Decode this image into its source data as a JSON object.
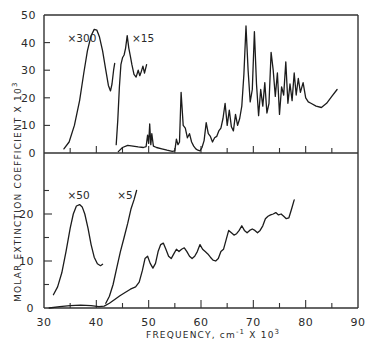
{
  "chart_data": [
    {
      "panel": "upper",
      "type": "line",
      "xlabel": "FREQUENCY, cm-1 X 10^3",
      "ylabel": "MOLAR EXTINCTION COEFFICIENT X 10^3",
      "xlim": [
        30,
        90
      ],
      "ylim": [
        0,
        50
      ],
      "x_ticks": [
        35,
        40,
        45,
        50,
        55,
        60,
        65,
        70,
        75,
        80,
        85
      ],
      "y_ticks": [
        0,
        10,
        20,
        30,
        40,
        50
      ],
      "y_tick_labels": [
        "0",
        "10",
        "20",
        "30",
        "40",
        "50"
      ],
      "grid": false,
      "annotations": [
        {
          "text": "x 300",
          "x": 34.5,
          "y": 41.5
        },
        {
          "text": "x 15",
          "x": 46.8,
          "y": 41.5
        }
      ],
      "series": [
        {
          "name": "x300",
          "scale": 300,
          "x": [
            33.8,
            34.8,
            35.8,
            36.8,
            37.6,
            38.3,
            39.0,
            39.6,
            40.1,
            40.6,
            41.2,
            41.8,
            42.3,
            42.7,
            43.0,
            43.3,
            43.5
          ],
          "y": [
            1.5,
            4.0,
            10.0,
            19.0,
            29.0,
            37.0,
            42.5,
            44.8,
            44.5,
            42.0,
            37.0,
            30.0,
            24.5,
            22.5,
            25.0,
            30.0,
            32.5
          ]
        },
        {
          "name": "x15",
          "scale": 15,
          "x": [
            43.8,
            44.1,
            44.4,
            44.7,
            45.0,
            45.3,
            45.6,
            45.9,
            46.2,
            46.5,
            46.8,
            47.2,
            47.6,
            48.0,
            48.3,
            48.6,
            48.9,
            49.2,
            49.6
          ],
          "y": [
            3.0,
            12.0,
            24.0,
            32.0,
            34.5,
            35.5,
            38.0,
            42.5,
            38.0,
            35.0,
            32.0,
            28.5,
            27.5,
            30.0,
            28.0,
            29.5,
            31.5,
            29.0,
            32.0
          ]
        },
        {
          "name": "x1",
          "scale": 1,
          "x": [
            44.2,
            45.0,
            46.0,
            47.0,
            48.0,
            49.0,
            49.5,
            49.8,
            50.0,
            50.2,
            50.4,
            50.6,
            50.9,
            51.5,
            52.5,
            53.5,
            54.5,
            55.0,
            55.3,
            55.6,
            55.9,
            56.2,
            56.6,
            57.0,
            57.4,
            57.8,
            58.2,
            58.6,
            59.0,
            59.4,
            59.8,
            60.2,
            60.6,
            61.0,
            61.4,
            61.8,
            62.2,
            62.6,
            63.0,
            63.4,
            63.8,
            64.2,
            64.6,
            65.0,
            65.4,
            65.8,
            66.2,
            66.6,
            67.0,
            67.4,
            67.8,
            68.2,
            68.6,
            69.0,
            69.4,
            69.8,
            70.2,
            70.6,
            71.0,
            71.4,
            71.8,
            72.2,
            72.6,
            73.0,
            73.4,
            73.8,
            74.2,
            74.6,
            75.0,
            75.4,
            75.8,
            76.2,
            76.6,
            77.0,
            77.4,
            77.8,
            78.2,
            78.6,
            79.0,
            79.5,
            80.0,
            80.5,
            81.0,
            82.0,
            83.0,
            84.0,
            85.0,
            86.0
          ],
          "y": [
            0.5,
            2.0,
            2.8,
            2.5,
            2.2,
            2.0,
            2.3,
            6.5,
            3.5,
            10.5,
            3.0,
            7.0,
            2.5,
            2.0,
            1.5,
            1.0,
            0.6,
            0.8,
            5.0,
            3.0,
            4.0,
            22.0,
            10.0,
            9.0,
            5.5,
            7.0,
            4.0,
            2.5,
            1.5,
            1.0,
            0.8,
            2.0,
            4.5,
            11.0,
            7.0,
            6.0,
            4.0,
            5.5,
            6.0,
            8.0,
            9.0,
            12.5,
            18.0,
            10.0,
            15.5,
            9.5,
            8.0,
            14.0,
            10.0,
            12.5,
            17.0,
            28.5,
            46.0,
            30.0,
            18.5,
            23.0,
            44.0,
            25.0,
            13.5,
            23.0,
            17.0,
            25.5,
            14.5,
            18.0,
            36.5,
            30.0,
            20.5,
            29.0,
            14.0,
            24.0,
            21.0,
            33.0,
            18.0,
            25.0,
            19.0,
            29.0,
            21.0,
            27.0,
            22.0,
            25.5,
            20.0,
            18.5,
            18.0,
            17.0,
            16.5,
            18.0,
            20.5,
            23.0
          ]
        }
      ]
    },
    {
      "panel": "lower",
      "type": "line",
      "xlim": [
        30,
        90
      ],
      "ylim": [
        0,
        30
      ],
      "x_ticks": [
        30,
        35,
        40,
        45,
        50,
        55,
        60,
        65,
        70,
        75,
        80,
        85,
        90
      ],
      "x_tick_labels": [
        "30",
        "40",
        "50",
        "60",
        "70",
        "80",
        "90"
      ],
      "x_tick_label_values": [
        30,
        40,
        50,
        60,
        70,
        80,
        90
      ],
      "y_ticks": [
        0,
        5,
        10,
        15,
        20,
        25
      ],
      "y_tick_labels": [
        "0",
        "10",
        "20"
      ],
      "y_tick_label_values": [
        0,
        10,
        20
      ],
      "grid": false,
      "annotations": [
        {
          "text": "x 50",
          "x": 34.5,
          "y": 24.0
        },
        {
          "text": "x 5",
          "x": 44.0,
          "y": 24.0
        }
      ],
      "series": [
        {
          "name": "x50",
          "scale": 50,
          "x": [
            31.8,
            32.6,
            33.4,
            34.2,
            35.0,
            35.6,
            36.2,
            36.8,
            37.3,
            37.8,
            38.4,
            39.0,
            39.6,
            40.2,
            40.8,
            41.2
          ],
          "y": [
            2.8,
            4.5,
            7.5,
            12.0,
            17.0,
            20.0,
            21.7,
            22.0,
            21.5,
            20.0,
            17.0,
            13.5,
            10.8,
            9.4,
            9.0,
            9.3
          ]
        },
        {
          "name": "x5",
          "scale": 5,
          "x": [
            41.8,
            42.5,
            43.2,
            43.9,
            44.6,
            45.3,
            46.0,
            46.6,
            47.2,
            47.7
          ],
          "y": [
            1.0,
            2.5,
            5.0,
            8.5,
            12.0,
            15.0,
            18.0,
            21.0,
            23.0,
            25.0
          ]
        },
        {
          "name": "x1",
          "scale": 1,
          "x": [
            31.0,
            33.0,
            35.0,
            37.0,
            39.0,
            40.5,
            41.5,
            42.5,
            43.5,
            44.5,
            45.5,
            46.5,
            47.5,
            48.2,
            48.8,
            49.3,
            49.8,
            50.3,
            50.8,
            51.3,
            51.8,
            52.3,
            52.8,
            53.3,
            53.8,
            54.3,
            54.8,
            55.3,
            55.8,
            56.3,
            56.8,
            57.3,
            57.8,
            58.3,
            58.8,
            59.3,
            59.8,
            60.3,
            60.8,
            61.3,
            61.8,
            62.3,
            62.8,
            63.3,
            63.8,
            64.3,
            64.8,
            65.3,
            65.8,
            66.3,
            66.8,
            67.3,
            67.8,
            68.3,
            68.8,
            69.3,
            69.8,
            70.3,
            70.8,
            71.3,
            71.8,
            72.3,
            72.8,
            73.3,
            73.8,
            74.3,
            74.8,
            75.3,
            75.8,
            76.3,
            76.8,
            77.3,
            77.8
          ],
          "y": [
            0.0,
            0.3,
            0.5,
            0.6,
            0.5,
            0.3,
            0.4,
            1.0,
            1.8,
            2.6,
            3.3,
            4.0,
            4.5,
            5.5,
            8.0,
            10.5,
            11.0,
            9.5,
            8.5,
            9.5,
            12.0,
            13.5,
            13.8,
            12.5,
            11.0,
            10.5,
            11.5,
            12.5,
            12.0,
            12.5,
            12.8,
            12.0,
            11.0,
            10.5,
            11.0,
            12.0,
            13.5,
            12.5,
            12.0,
            11.5,
            10.8,
            10.2,
            10.0,
            10.5,
            12.0,
            12.5,
            14.5,
            16.5,
            16.0,
            15.5,
            15.8,
            16.5,
            17.5,
            16.5,
            16.0,
            16.5,
            16.8,
            16.5,
            16.0,
            16.5,
            17.5,
            19.0,
            19.5,
            19.8,
            20.0,
            20.3,
            19.8,
            20.0,
            19.5,
            19.0,
            19.2,
            21.0,
            23.0
          ]
        }
      ]
    }
  ],
  "labels": {
    "y_axis_title": "MOLAR EXTINCTION COEFFICIENT X 10",
    "y_axis_exp": "3",
    "x_axis_title_main": "FREQUENCY, cm",
    "x_axis_title_sup1": "-1",
    "x_axis_title_mid": " X 10",
    "x_axis_title_sup2": "3"
  }
}
